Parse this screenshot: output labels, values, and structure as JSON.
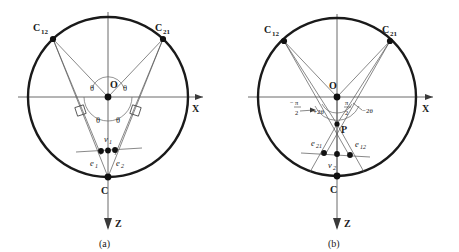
{
  "figure": {
    "background_color": "#ffffff",
    "ink_color": "#1a1a1a",
    "thin_line_color": "#4a4a4a",
    "panels": [
      {
        "id": "panel-a",
        "caption": "(a)",
        "circle": {
          "cx": 108,
          "cy": 97,
          "r": 80
        },
        "axis_x_label": "X",
        "axis_z_label": "Z",
        "center_label": "O",
        "bottom_label": "C",
        "corner_left_label": "C",
        "corner_left_sub": "12",
        "corner_right_label": "C",
        "corner_right_sub": "21",
        "vertex_label": "v",
        "vertex_sub": "1",
        "edge_left_label": "e",
        "edge_left_sub": "1",
        "edge_right_label": "e",
        "edge_right_sub": "2",
        "angle_labels": [
          "θ",
          "θ",
          "θ",
          "θ"
        ],
        "right_angle_marks": 2
      },
      {
        "id": "panel-b",
        "caption": "(b)",
        "circle": {
          "cx": 337,
          "cy": 97,
          "r": 79
        },
        "axis_x_label": "X",
        "axis_z_label": "Z",
        "center_label": "O",
        "bottom_label": "C",
        "inner_point_label": "P",
        "corner_left_label": "C",
        "corner_left_sub": "12",
        "corner_right_label": "C",
        "corner_right_sub": "21",
        "vertex_label": "v",
        "vertex_sub": "2",
        "edge_left_label": "e",
        "edge_left_sub": "21",
        "edge_right_label": "e",
        "edge_right_sub": "12",
        "angle_left_prefix": "−",
        "angle_left_numer": "π",
        "angle_left_denom": "2",
        "angle_left_suffix": "+2θ",
        "angle_right_numer": "π",
        "angle_right_denom": "2",
        "angle_right_suffix": "−2θ"
      }
    ]
  }
}
